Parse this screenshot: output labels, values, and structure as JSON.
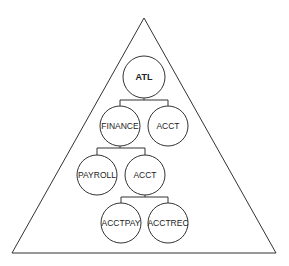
{
  "diagram": {
    "type": "hierarchy-tree-in-triangle",
    "container": {
      "shape": "triangle",
      "apex": [
        144,
        18
      ],
      "base_left": [
        12,
        253
      ],
      "base_right": [
        276,
        253
      ]
    },
    "nodes": [
      {
        "id": "atl",
        "label": "ATL",
        "cx": 144,
        "cy": 77,
        "r": 21,
        "bold": true
      },
      {
        "id": "finance",
        "label": "FINANCE",
        "cx": 120,
        "cy": 126,
        "r": 20
      },
      {
        "id": "acct-top",
        "label": "ACCT",
        "cx": 168,
        "cy": 126,
        "r": 20
      },
      {
        "id": "payroll",
        "label": "PAYROLL",
        "cx": 97,
        "cy": 175,
        "r": 20
      },
      {
        "id": "acct-mid",
        "label": "ACCT",
        "cx": 145,
        "cy": 175,
        "r": 20
      },
      {
        "id": "acctpay",
        "label": "ACCTPAY",
        "cx": 121,
        "cy": 223,
        "r": 20
      },
      {
        "id": "acctrec",
        "label": "ACCTREC",
        "cx": 168,
        "cy": 223,
        "r": 20
      }
    ],
    "edges": [
      {
        "from": "atl",
        "to": [
          "finance",
          "acct-top"
        ]
      },
      {
        "from": "finance",
        "to": [
          "payroll",
          "acct-mid"
        ]
      },
      {
        "from": "acct-mid",
        "to": [
          "acctpay",
          "acctrec"
        ]
      }
    ],
    "colors": {
      "stroke": "#333333",
      "text": "#222222",
      "background": "#ffffff"
    }
  }
}
